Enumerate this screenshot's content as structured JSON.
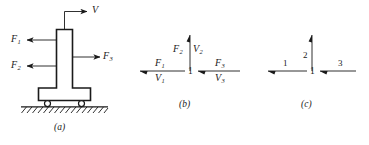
{
  "figure": {
    "panel_a": {
      "caption": "(a)",
      "velocity_label": "V",
      "force_1": "F",
      "force_1_sub": "1",
      "force_2": "F",
      "force_2_sub": "2",
      "force_3": "F",
      "force_3_sub": "3",
      "icons": {
        "body": "t-shaped-column",
        "support": "rolling-wheel",
        "ground": "hatched-ground"
      }
    },
    "panel_b": {
      "caption": "(b)",
      "node_label": "1",
      "bonds": [
        {
          "name": "bond-left",
          "effort": "F",
          "effort_sub": "1",
          "flow": "V",
          "flow_sub": "1",
          "direction": "left"
        },
        {
          "name": "bond-up",
          "effort": "F",
          "effort_sub": "2",
          "flow": "V",
          "flow_sub": "2",
          "direction": "up"
        },
        {
          "name": "bond-right",
          "effort": "F",
          "effort_sub": "3",
          "flow": "V",
          "flow_sub": "3",
          "direction": "left"
        }
      ]
    },
    "panel_c": {
      "caption": "(c)",
      "node_label": "1",
      "bonds": [
        {
          "name": "bond-left",
          "label": "1",
          "direction": "left"
        },
        {
          "name": "bond-up",
          "label": "2",
          "direction": "up"
        },
        {
          "name": "bond-right",
          "label": "3",
          "direction": "left"
        }
      ]
    }
  },
  "style": {
    "ink": "#1a1a1a",
    "background": "#ffffff"
  }
}
